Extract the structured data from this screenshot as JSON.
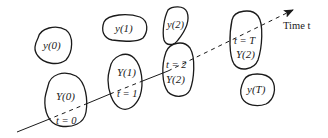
{
  "axis": {
    "label": "Time t"
  },
  "blobs": [
    {
      "id": "y0",
      "label": "y(0)"
    },
    {
      "id": "y1",
      "label": "y(1)"
    },
    {
      "id": "y2",
      "label": "y(2)"
    },
    {
      "id": "Y0",
      "label_top": "Y(0)",
      "label_bottom": "t = 0"
    },
    {
      "id": "Y1",
      "label_top": "Y(1)",
      "label_bottom": "t = 1"
    },
    {
      "id": "Y2",
      "label_top": "t = 2",
      "label_bottom": "Y(2)"
    },
    {
      "id": "YT",
      "label_top": "t = T",
      "label_bottom": "Y(2)"
    },
    {
      "id": "yT",
      "label": "y(T)"
    }
  ],
  "colors": {
    "stroke": "#1a1a1a",
    "background": "#ffffff"
  }
}
